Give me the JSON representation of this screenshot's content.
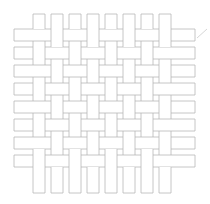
{
  "figure": {
    "name": "woven-lattice-pattern",
    "type": "plain-weave-basket-lattice",
    "canvas": {
      "width": 210,
      "height": 204,
      "background": "#ffffff"
    },
    "style": {
      "stroke_color": "#b3b3b3",
      "stroke_width": 0.75,
      "strip_fill": "#ffffff"
    },
    "geometry": {
      "strip_thickness": 12,
      "pitch": 18,
      "vertical_count": 8,
      "horizontal_count": 8,
      "vertical_x_positions": [
        33,
        51,
        69,
        87,
        105,
        123,
        141,
        159
      ],
      "horizontal_y_positions": [
        29,
        47,
        65,
        83,
        101,
        119,
        137,
        155
      ],
      "vertical_span": {
        "top": 14,
        "bottom": 193
      },
      "horizontal_span": {
        "left": 14,
        "right": 195
      },
      "weave_rule": "horizontal-over-when-row-plus-col-is-even"
    },
    "artifact": {
      "name": "diagonal-tick-mark",
      "x1": 197,
      "y1": 38,
      "x2": 207,
      "y2": 29,
      "stroke_color": "#cccccc",
      "stroke_width": 0.8
    }
  }
}
